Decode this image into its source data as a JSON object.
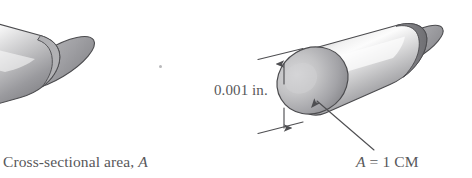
{
  "figure": {
    "type": "technical-illustration",
    "background_color": "#ffffff",
    "width": 472,
    "height": 178
  },
  "labels": {
    "cross_section_text": "Cross-sectional area,",
    "cross_section_symbol": "A",
    "dimension_text": "0.001 in.",
    "area_symbol": "A",
    "area_equation_rest": "= 1 CM",
    "text_color": "#58585a"
  },
  "objects": {
    "left_cylinder": {
      "name": "cross-sectional-area-cylinder",
      "clipped": true,
      "highlight_color": "#fbfbfb",
      "mid_color": "#c9c9cb",
      "shadow_color": "#7e7e82",
      "outline_color": "#4b4b4e"
    },
    "right_cylinder": {
      "name": "one-circular-mil-cylinder",
      "clipped": false,
      "highlight_color": "#fbfbfb",
      "mid_color": "#c9c9cb",
      "shadow_color": "#7e7e82",
      "outline_color": "#4b4b4e",
      "face_fill_light": "#c4c4c6",
      "face_fill_dark": "#86868a"
    }
  },
  "annotations": {
    "dimension_line": {
      "name": "diameter-dimension-line",
      "style": "double-headed-vertical-arrow",
      "color": "#4f4f52"
    },
    "leader_line": {
      "name": "area-leader-line",
      "style": "single-arrow",
      "color": "#4f4f52"
    },
    "speck": {
      "name": "print-speck",
      "color": "#b9b9bb"
    }
  }
}
